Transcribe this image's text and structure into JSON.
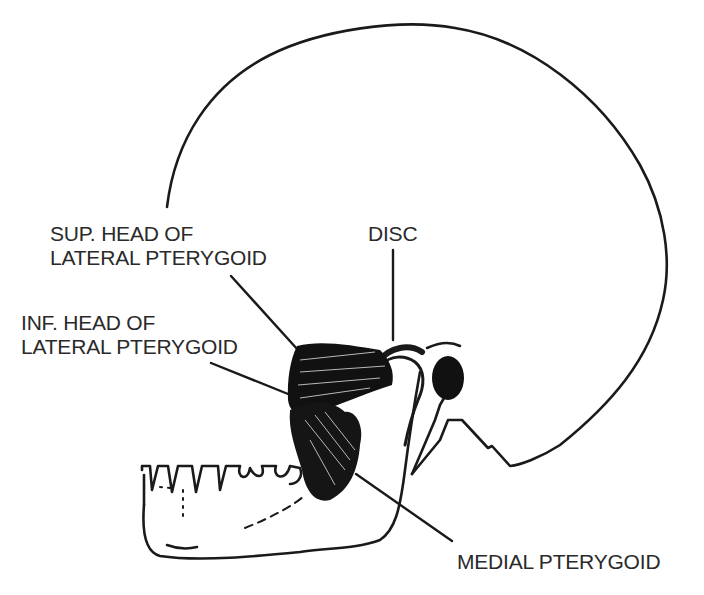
{
  "diagram": {
    "labels": {
      "sup_head": {
        "line1": "SUP. HEAD OF",
        "line2": "LATERAL PTERYGOID"
      },
      "disc": "DISC",
      "inf_head": {
        "line1": "INF. HEAD OF",
        "line2": "LATERAL PTERYGOID"
      },
      "medial": "MEDIAL PTERYGOID"
    },
    "colors": {
      "ink": "#1a1a1a",
      "background": "#ffffff"
    }
  }
}
